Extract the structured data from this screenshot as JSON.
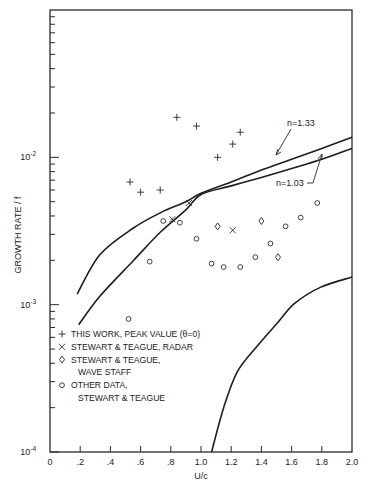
{
  "chart_data": {
    "type": "scatter",
    "title": "",
    "xlabel": "U/c",
    "ylabel": "GROWTH RATE / f",
    "xlim": [
      0,
      2.0
    ],
    "ylim": [
      0.0001,
      0.1
    ],
    "yscale": "log",
    "grid": false,
    "x_ticks": [
      0,
      0.2,
      0.4,
      0.6,
      0.8,
      1.0,
      1.2,
      1.4,
      1.6,
      1.8,
      2.0
    ],
    "x_tick_labels": [
      "0",
      ".2",
      ".4",
      ".6",
      ".8",
      "1.0",
      "1.2",
      "1.4",
      "1.6",
      "1.8",
      "2.0"
    ],
    "y_tick_labels": [
      {
        "value": 0.01,
        "label": "10",
        "exp": "-2"
      },
      {
        "value": 0.001,
        "label": "10",
        "exp": "-3"
      },
      {
        "value": 0.0001,
        "label": "10",
        "exp": "-4"
      }
    ],
    "series": [
      {
        "name": "THIS WORK, PEAK VALUE (θ=0)",
        "marker": "plus",
        "points": [
          [
            0.53,
            0.0068
          ],
          [
            0.6,
            0.0058
          ],
          [
            0.73,
            0.006
          ],
          [
            0.84,
            0.0187
          ],
          [
            0.97,
            0.0163
          ],
          [
            1.11,
            0.01
          ],
          [
            1.21,
            0.0123
          ],
          [
            1.26,
            0.0148
          ]
        ]
      },
      {
        "name": "STEWART & TEAGUE, RADAR",
        "marker": "cross",
        "points": [
          [
            0.81,
            0.0038
          ],
          [
            0.92,
            0.0049
          ],
          [
            1.21,
            0.0032
          ]
        ]
      },
      {
        "name": "STEWART & TEAGUE, WAVE STAFF",
        "marker": "diamond",
        "points": [
          [
            1.11,
            0.0034
          ],
          [
            1.4,
            0.0037
          ],
          [
            1.51,
            0.0021
          ]
        ]
      },
      {
        "name": "OTHER DATA, STEWART & TEAGUE",
        "marker": "circle",
        "points": [
          [
            0.52,
            0.0008
          ],
          [
            0.66,
            0.00196
          ],
          [
            0.75,
            0.0037
          ],
          [
            0.86,
            0.0036
          ],
          [
            0.97,
            0.0028
          ],
          [
            1.07,
            0.0019
          ],
          [
            1.15,
            0.0018
          ],
          [
            1.26,
            0.0018
          ],
          [
            1.36,
            0.0021
          ],
          [
            1.46,
            0.0026
          ],
          [
            1.56,
            0.0034
          ],
          [
            1.66,
            0.0039
          ],
          [
            1.77,
            0.0049
          ]
        ]
      }
    ],
    "curves": [
      {
        "name": "n=1.33",
        "points": [
          [
            0.18,
            0.00118
          ],
          [
            0.33,
            0.00218
          ],
          [
            0.55,
            0.0033
          ],
          [
            0.73,
            0.0042
          ],
          [
            0.9,
            0.005
          ],
          [
            1.0,
            0.0057
          ],
          [
            1.2,
            0.0068
          ],
          [
            1.4,
            0.0082
          ],
          [
            1.6,
            0.0097
          ],
          [
            1.8,
            0.0115
          ],
          [
            2.0,
            0.0137
          ]
        ]
      },
      {
        "name": "n=1.03",
        "points": [
          [
            0.19,
            0.00073
          ],
          [
            0.33,
            0.00114
          ],
          [
            0.55,
            0.00198
          ],
          [
            0.73,
            0.0031
          ],
          [
            0.9,
            0.0044
          ],
          [
            1.0,
            0.0056
          ],
          [
            1.2,
            0.0064
          ],
          [
            1.4,
            0.0073
          ],
          [
            1.6,
            0.0084
          ],
          [
            1.8,
            0.0097
          ],
          [
            2.0,
            0.0115
          ]
        ]
      },
      {
        "name": "lower curve",
        "points": [
          [
            1.07,
            0.0001
          ],
          [
            1.15,
            0.0002
          ],
          [
            1.24,
            0.00035
          ],
          [
            1.37,
            0.00052
          ],
          [
            1.51,
            0.00076
          ],
          [
            1.62,
            0.00102
          ],
          [
            1.79,
            0.00131
          ],
          [
            2.0,
            0.00154
          ]
        ]
      }
    ],
    "annotations": [
      {
        "text": "n=1.33",
        "x": 1.58,
        "y": 0.0183
      },
      {
        "text": "n=1.03",
        "x": 1.48,
        "y": 0.0058
      }
    ],
    "legend": {
      "position": "lower-left",
      "entries": [
        {
          "marker": "+",
          "lines": [
            "THIS WORK, PEAK VALUE (θ=0)"
          ]
        },
        {
          "marker": "×",
          "lines": [
            "STEWART & TEAGUE, RADAR"
          ]
        },
        {
          "marker": "◇",
          "lines": [
            "STEWART & TEAGUE,",
            "WAVE STAFF"
          ]
        },
        {
          "marker": "○",
          "lines": [
            "OTHER DATA,",
            "STEWART & TEAGUE"
          ]
        }
      ]
    }
  }
}
